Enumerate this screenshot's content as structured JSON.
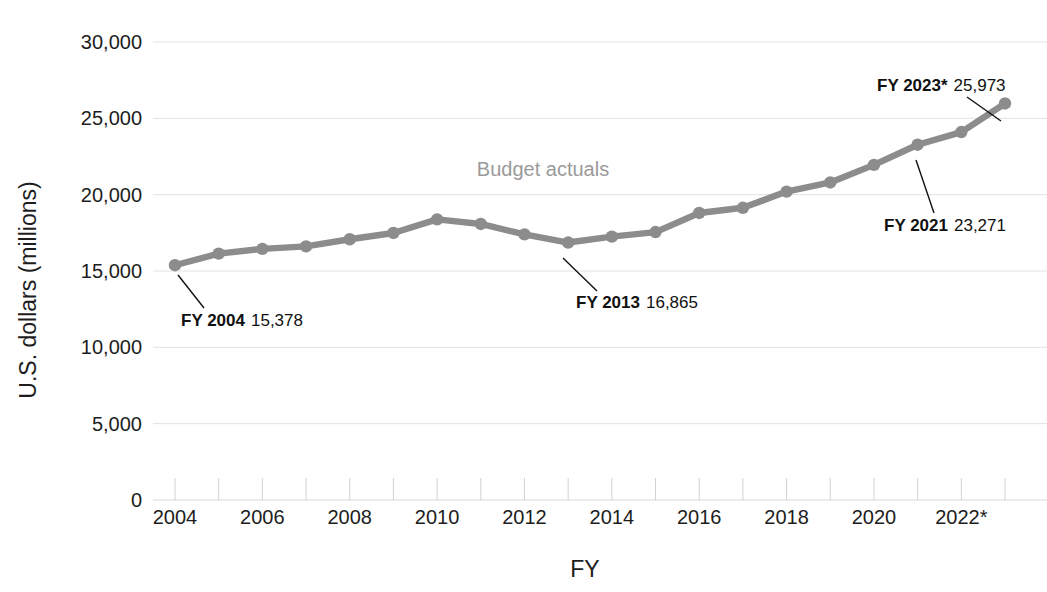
{
  "chart_data": {
    "type": "line",
    "title": "",
    "xlabel": "FY",
    "ylabel": "U.S. dollars (millions)",
    "ylim": [
      0,
      30000
    ],
    "ytick_values": [
      0,
      5000,
      10000,
      15000,
      20000,
      25000,
      30000
    ],
    "ytick_labels": [
      "0",
      "5,000",
      "10,000",
      "15,000",
      "20,000",
      "25,000",
      "30,000"
    ],
    "grid": true,
    "legend_position": "inline-annotation",
    "x": [
      2004,
      2005,
      2006,
      2007,
      2008,
      2009,
      2010,
      2011,
      2012,
      2013,
      2014,
      2015,
      2016,
      2017,
      2018,
      2019,
      2020,
      2021,
      2022,
      2023
    ],
    "xtick_values": [
      2004,
      2006,
      2008,
      2010,
      2012,
      2014,
      2016,
      2018,
      2020,
      2022
    ],
    "xtick_labels": [
      "2004",
      "2006",
      "2008",
      "2010",
      "2012",
      "2014",
      "2016",
      "2018",
      "2020",
      "2022*"
    ],
    "series": [
      {
        "name": "Budget actuals",
        "color": "#8c8c8c",
        "values": [
          15378,
          16135,
          16450,
          16610,
          17080,
          17490,
          18380,
          18080,
          17400,
          16865,
          17250,
          17550,
          18800,
          19140,
          20200,
          20800,
          21950,
          23271,
          24100,
          25973
        ]
      }
    ],
    "series_label": {
      "text": "Budget actuals",
      "color": "#9a9a9a"
    },
    "annotations": [
      {
        "name": "fy-2004",
        "bold": "FY 2004",
        "value": "15,378",
        "point_x": 2004,
        "point_y": 15378
      },
      {
        "name": "fy-2013",
        "bold": "FY 2013",
        "value": "16,865",
        "point_x": 2013,
        "point_y": 16865
      },
      {
        "name": "fy-2021",
        "bold": "FY 2021",
        "value": "23,271",
        "point_x": 2021,
        "point_y": 23271
      },
      {
        "name": "fy-2023",
        "bold": "FY 2023*",
        "value": "25,973",
        "point_x": 2023,
        "point_y": 25973
      }
    ]
  },
  "layout": {
    "plot_left": 175,
    "plot_right": 1005,
    "plot_top": 42,
    "plot_bottom": 500,
    "marker_radius": 6.2,
    "line_width": 6.4,
    "annotation_positions": [
      {
        "label_x": 181,
        "label_y": 326,
        "leader_x1": 178,
        "leader_y1": 275,
        "leader_x2": 204,
        "leader_y2": 308
      },
      {
        "label_x": 576,
        "label_y": 308,
        "leader_x1": 563,
        "leader_y1": 258,
        "leader_x2": 597,
        "leader_y2": 291
      },
      {
        "label_x": 884,
        "label_y": 231,
        "leader_x1": 916,
        "leader_y1": 160,
        "leader_x2": 934,
        "leader_y2": 213
      },
      {
        "label_x": 877,
        "label_y": 91,
        "leader_x1": 1001,
        "leader_y1": 121,
        "leader_x2": 967,
        "leader_y2": 97
      }
    ],
    "series_label_pos": {
      "x": 543,
      "y": 176
    },
    "xlabel_pos": {
      "x": 585,
      "y": 577
    },
    "ylabel_pos": {
      "x": 36,
      "y": 290
    }
  }
}
